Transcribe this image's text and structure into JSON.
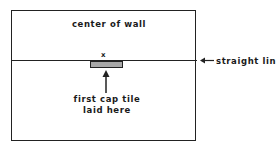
{
  "diagram": {
    "wall_label": "center of wall",
    "center_mark": "x",
    "line_label": "straight line",
    "tile_caption_line1": "first cap tile",
    "tile_caption_line2": "laid here"
  },
  "colors": {
    "stroke": "#222222",
    "tile_fill": "#a8a8a8",
    "background": "#ffffff"
  }
}
